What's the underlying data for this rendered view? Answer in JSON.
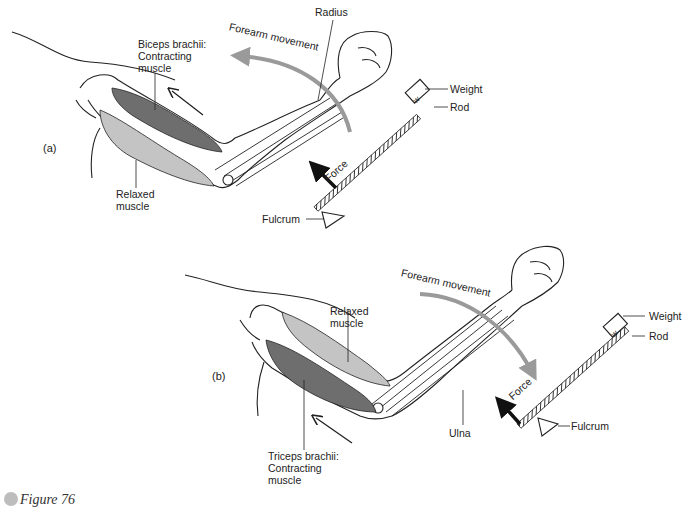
{
  "figure": {
    "caption_label": "Figure",
    "caption_number": "76",
    "colors": {
      "contracting_muscle": "#6e6e6e",
      "relaxed_muscle": "#c4c4c4",
      "movement_arrow": "#9a9a9a",
      "outline": "#222222"
    }
  },
  "panel_a": {
    "tag": "(a)",
    "labels": {
      "radius": "Radius",
      "forearm_movement": "Forearm movement",
      "biceps_line1": "Biceps brachii:",
      "biceps_line2": "Contracting",
      "biceps_line3": "muscle",
      "relaxed_line1": "Relaxed",
      "relaxed_line2": "muscle",
      "weight": "Weight",
      "weight_box": "w",
      "rod": "Rod",
      "force": "Force",
      "fulcrum": "Fulcrum"
    }
  },
  "panel_b": {
    "tag": "(b)",
    "labels": {
      "forearm_movement": "Forearm movement",
      "relaxed_line1": "Relaxed",
      "relaxed_line2": "muscle",
      "triceps_line1": "Triceps brachii:",
      "triceps_line2": "Contracting",
      "triceps_line3": "muscle",
      "ulna": "Ulna",
      "weight": "Weight",
      "weight_box": "w",
      "rod": "Rod",
      "force": "Force",
      "fulcrum": "Fulcrum"
    }
  }
}
